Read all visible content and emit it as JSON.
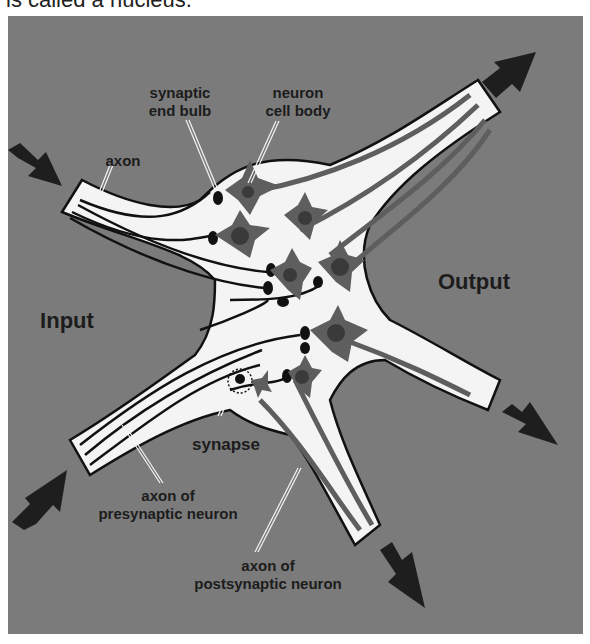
{
  "caption": {
    "text": "is called a nucleus."
  },
  "diagram": {
    "colors": {
      "background_panel": "#7b7b7b",
      "tract_fill": "#f4f4f4",
      "outline": "#111111",
      "cell_body": "#5e5e5e",
      "cell_nucleus": "#3a3a3a",
      "arrow": "#1e1e1e",
      "label_text": "#1c1c1c"
    },
    "labels": {
      "synaptic_end_bulb_line1": "synaptic",
      "synaptic_end_bulb_line2": "end bulb",
      "neuron_cell_body_line1": "neuron",
      "neuron_cell_body_line2": "cell body",
      "axon": "axon",
      "input": "Input",
      "output": "Output",
      "synapse": "synapse",
      "axon_presynaptic_line1": "axon of",
      "axon_presynaptic_line2": "presynaptic neuron",
      "axon_postsynaptic_line1": "axon of",
      "axon_postsynaptic_line2": "postsynaptic neuron"
    },
    "arrows": [
      {
        "name": "input-arrow-top-left",
        "direction": "down-right"
      },
      {
        "name": "input-arrow-bottom-left",
        "direction": "up-right"
      },
      {
        "name": "output-arrow-top-right",
        "direction": "up-right"
      },
      {
        "name": "output-arrow-right",
        "direction": "down-right"
      },
      {
        "name": "output-arrow-bottom",
        "direction": "down-right"
      }
    ]
  }
}
